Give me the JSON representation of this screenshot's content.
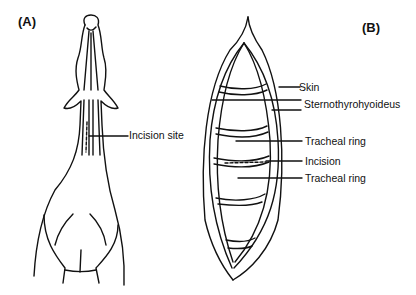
{
  "figure": {
    "panels": [
      {
        "id": "A",
        "label": "(A)"
      },
      {
        "id": "B",
        "label": "(B)"
      }
    ],
    "panel_a": {
      "callouts": [
        {
          "text": "Incision site"
        }
      ]
    },
    "panel_b": {
      "callouts": [
        {
          "text": "Skin"
        },
        {
          "text": "Sternothyrohyoideus"
        },
        {
          "text": "Tracheal ring"
        },
        {
          "text": "Incision"
        },
        {
          "text": "Tracheal ring"
        }
      ]
    },
    "colors": {
      "line": "#111111",
      "background": "#ffffff"
    }
  }
}
